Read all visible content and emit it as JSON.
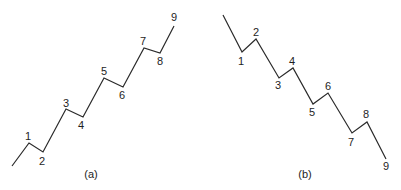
{
  "panels": [
    {
      "id": "a",
      "caption": "(a)",
      "caption_pos": [
        91,
        175
      ],
      "trend": "up",
      "points": [
        [
          12,
          166
        ],
        [
          29,
          143
        ],
        [
          43,
          152
        ],
        [
          66,
          109
        ],
        [
          83,
          117
        ],
        [
          104,
          78
        ],
        [
          123,
          87
        ],
        [
          144,
          48
        ],
        [
          160,
          53
        ],
        [
          174,
          26
        ]
      ],
      "labels": [
        {
          "text": "1",
          "x": 28,
          "y": 137
        },
        {
          "text": "2",
          "x": 42,
          "y": 162
        },
        {
          "text": "3",
          "x": 66,
          "y": 104
        },
        {
          "text": "4",
          "x": 81,
          "y": 126
        },
        {
          "text": "5",
          "x": 104,
          "y": 72
        },
        {
          "text": "6",
          "x": 122,
          "y": 96
        },
        {
          "text": "7",
          "x": 143,
          "y": 42
        },
        {
          "text": "8",
          "x": 160,
          "y": 62
        },
        {
          "text": "9",
          "x": 174,
          "y": 18
        }
      ]
    },
    {
      "id": "b",
      "caption": "(b)",
      "caption_pos": [
        305,
        175
      ],
      "trend": "down",
      "points": [
        [
          223,
          15
        ],
        [
          242,
          52
        ],
        [
          256,
          39
        ],
        [
          279,
          78
        ],
        [
          293,
          68
        ],
        [
          313,
          104
        ],
        [
          328,
          93
        ],
        [
          352,
          133
        ],
        [
          367,
          122
        ],
        [
          386,
          159
        ]
      ],
      "labels": [
        {
          "text": "1",
          "x": 241,
          "y": 62
        },
        {
          "text": "2",
          "x": 256,
          "y": 33
        },
        {
          "text": "3",
          "x": 278,
          "y": 86
        },
        {
          "text": "4",
          "x": 292,
          "y": 62
        },
        {
          "text": "5",
          "x": 312,
          "y": 113
        },
        {
          "text": "6",
          "x": 328,
          "y": 87
        },
        {
          "text": "7",
          "x": 351,
          "y": 143
        },
        {
          "text": "8",
          "x": 366,
          "y": 115
        },
        {
          "text": "9",
          "x": 386,
          "y": 167
        }
      ]
    }
  ],
  "colors": {
    "line": "#2a2a2a",
    "text": "#1e1e1e",
    "background": "#ffffff"
  }
}
